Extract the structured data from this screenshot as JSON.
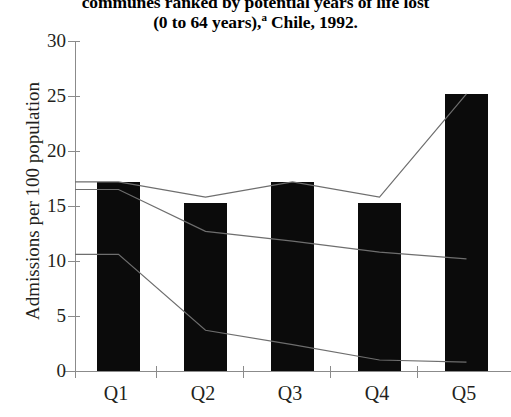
{
  "chart_data": {
    "type": "bar",
    "title": "communes ranked by potential years of life lost (0 to 64 years),a Chile, 1992.",
    "title_lines": [
      "communes ranked by potential years of life lost",
      "(0 to 64 years),"
    ],
    "title_superscript": "a",
    "title_tail": " Chile, 1992.",
    "xlabel": "",
    "ylabel": "Admissions per 100 population",
    "categories": [
      "Q1",
      "Q2",
      "Q3",
      "Q4",
      "Q5"
    ],
    "ylim": [
      0,
      30
    ],
    "yticks": [
      0,
      5,
      10,
      15,
      20,
      25,
      30
    ],
    "grid": false,
    "legend": "none",
    "values": [
      17.2,
      15.3,
      17.2,
      15.3,
      25.2
    ],
    "bar_color": "#0b0b0b",
    "axis_color": "#8b8b8b",
    "series": [
      {
        "name": "line-upper",
        "values": [
          17.2,
          15.8,
          17.2,
          15.8,
          25.2
        ],
        "color": "#6e6e6e"
      },
      {
        "name": "line-middle",
        "values": [
          16.5,
          12.7,
          11.8,
          10.8,
          10.2
        ],
        "color": "#6e6e6e"
      },
      {
        "name": "line-lower",
        "values": [
          10.6,
          3.7,
          2.4,
          1.0,
          0.8
        ],
        "color": "#6e6e6e"
      }
    ]
  },
  "axis": {
    "ytick_labels": [
      "0",
      "5",
      "10",
      "15",
      "20",
      "25",
      "30"
    ],
    "xtick_labels": [
      "Q1",
      "Q2",
      "Q3",
      "Q4",
      "Q5"
    ]
  }
}
